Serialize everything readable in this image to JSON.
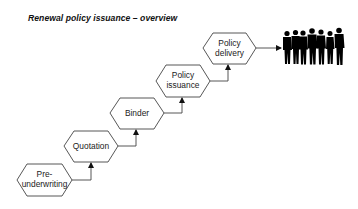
{
  "title": "Renewal policy issuance – overview",
  "steps": [
    {
      "id": "pre-underwriting",
      "lines": [
        "Pre-",
        "underwriting"
      ]
    },
    {
      "id": "quotation",
      "lines": [
        "Quotation"
      ]
    },
    {
      "id": "binder",
      "lines": [
        "Binder"
      ]
    },
    {
      "id": "policy-issuance",
      "lines": [
        "Policy",
        "issuance"
      ]
    },
    {
      "id": "policy-delivery",
      "lines": [
        "Policy",
        "delivery"
      ]
    }
  ],
  "end_target": {
    "icon": "people-group-icon",
    "description": "group of customers silhouettes"
  },
  "colors": {
    "stroke": "#333333",
    "text": "#222222",
    "silhouette": "#000000",
    "background": "#ffffff"
  }
}
